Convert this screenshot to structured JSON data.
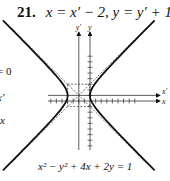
{
  "problem": {
    "number": "21.",
    "equation": "x = x′ − 2, y = y′ + 1"
  },
  "left_fragments": [
    "= 0",
    "x′",
    "x"
  ],
  "caption": "x² − y² + 4x + 2y = 1",
  "chart_data": {
    "type": "line",
    "title": "x = x′ − 2, y = y′ + 1",
    "caption": "x² − y² + 4x + 2y = 1",
    "curve": "hyperbola (x′)² − (y′)² = 4",
    "center_xy": [
      -2,
      1
    ],
    "a": 2,
    "b": 2,
    "asymptotes": [
      "y′ = x′",
      "y′ = −x′"
    ],
    "axes": {
      "primary": {
        "x_label": "x",
        "y_label": "y"
      },
      "translated": {
        "x_label": "x′",
        "y_label": "y′"
      }
    },
    "xlim": [
      -9,
      9
    ],
    "ylim": [
      -8,
      9
    ],
    "grid": false,
    "legend": "none"
  }
}
